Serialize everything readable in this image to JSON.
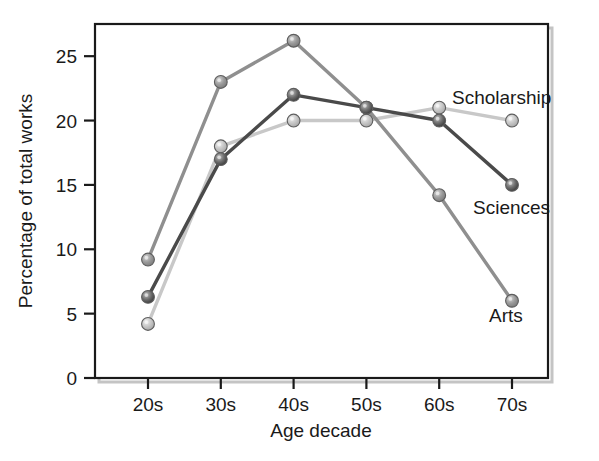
{
  "chart_data": {
    "type": "line",
    "title": "",
    "xlabel": "Age decade",
    "ylabel": "Percentage of total works",
    "categories": [
      "20s",
      "30s",
      "40s",
      "50s",
      "60s",
      "70s"
    ],
    "ytick_labels": [
      "0",
      "5",
      "10",
      "15",
      "20",
      "25"
    ],
    "ytick_values": [
      0,
      5,
      10,
      15,
      20,
      25
    ],
    "ylim": [
      0,
      27.5
    ],
    "grid": false,
    "legend": "inline-series-labels",
    "series": [
      {
        "name": "Arts",
        "color": "#8f8f8f",
        "values": [
          9.2,
          23.0,
          26.2,
          21.0,
          14.2,
          6.0
        ]
      },
      {
        "name": "Sciences",
        "color": "#4a4a4a",
        "values": [
          6.3,
          17.0,
          22.0,
          21.0,
          20.0,
          15.0
        ]
      },
      {
        "name": "Scholarship",
        "color": "#c8c8c8",
        "values": [
          4.2,
          18.0,
          20.0,
          20.0,
          21.0,
          20.0
        ]
      }
    ],
    "annotations": [
      {
        "text": "Scholarship",
        "x": 452,
        "y": 104
      },
      {
        "text": "Sciences",
        "x": 473,
        "y": 214
      },
      {
        "text": "Arts",
        "x": 489,
        "y": 322
      }
    ]
  },
  "axes": {
    "frame_color": "#1a1a1a",
    "shadow_color": "#bdbdbd"
  }
}
